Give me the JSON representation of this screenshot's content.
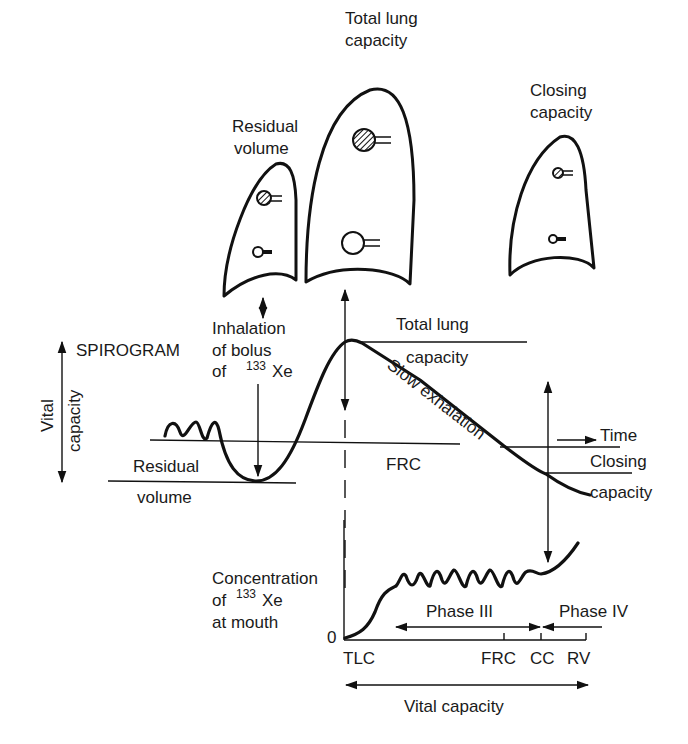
{
  "figure": {
    "lungs": [
      {
        "id": "residual-volume",
        "label_line1": "Residual",
        "label_line2": "volume"
      },
      {
        "id": "total-lung-capacity",
        "label_line1": "Total lung",
        "label_line2": "capacity"
      },
      {
        "id": "closing-capacity",
        "label_line1": "Closing",
        "label_line2": "capacity"
      }
    ],
    "spirogram": {
      "title": "SPIROGRAM",
      "vital_capacity_line1": "Vital",
      "vital_capacity_line2": "capacity",
      "inhalation_line1": "Inhalation",
      "inhalation_line2": "of bolus",
      "inhalation_line3_prefix": "of",
      "isotope_superscript": "133",
      "isotope_symbol": "Xe",
      "residual_line1": "Residual",
      "residual_line2": "volume",
      "tlc_line1": "Total lung",
      "tlc_line2": "capacity",
      "slow_exhalation": "Slow exhalation",
      "frc": "FRC",
      "time": "Time",
      "closing_line1": "Closing",
      "closing_line2": "capacity"
    },
    "concentration_plot": {
      "ylabel_line1": "Concentration",
      "ylabel_line2_prefix": "of",
      "ylabel_superscript": "133",
      "ylabel_symbol": "Xe",
      "ylabel_line3": "at mouth",
      "origin": "0",
      "phase3": "Phase III",
      "phase4": "Phase IV",
      "xticks": [
        "TLC",
        "FRC",
        "CC",
        "RV"
      ],
      "xaxis_label": "Vital capacity"
    }
  }
}
